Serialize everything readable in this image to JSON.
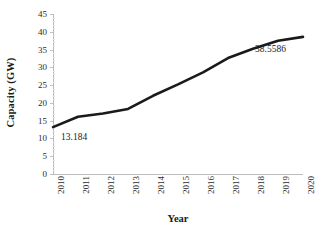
{
  "chart_data": {
    "type": "line",
    "title": "",
    "xlabel": "Year",
    "ylabel": "Capacity (GW)",
    "categories": [
      "2010",
      "2011",
      "2012",
      "2013",
      "2014",
      "2015",
      "2016",
      "2017",
      "2018",
      "2019",
      "2020"
    ],
    "values": [
      13.184,
      16.1,
      17.0,
      18.3,
      22.0,
      25.2,
      28.6,
      32.6,
      35.2,
      37.5,
      38.5586
    ],
    "series": [
      {
        "name": "Capacity",
        "values": [
          13.184,
          16.1,
          17.0,
          18.3,
          22.0,
          25.2,
          28.6,
          32.6,
          35.2,
          37.5,
          38.5586
        ],
        "color": "#1a1a1a"
      }
    ],
    "ylim": [
      0,
      45
    ],
    "ytick_labels": [
      "0",
      "5",
      "10",
      "15",
      "20",
      "25",
      "30",
      "35",
      "40",
      "45"
    ],
    "ytick_values": [
      0,
      5,
      10,
      15,
      20,
      25,
      30,
      35,
      40,
      45
    ],
    "xtick_labels": [
      "2010",
      "2011",
      "2012",
      "2013",
      "2014",
      "2015",
      "2016",
      "2017",
      "2018",
      "2019",
      "2020"
    ],
    "xtick_rotation": -90,
    "grid": false,
    "legend": false,
    "legend_position": "none",
    "annotations": [
      {
        "text": "13.184",
        "point_index": 0,
        "value": 13.184
      },
      {
        "text": "38.5586",
        "point_index": 10,
        "value": 38.5586
      }
    ],
    "line_color": "#1a1a1a",
    "line_width": 2.6,
    "markers": false,
    "background": "#ffffff"
  }
}
